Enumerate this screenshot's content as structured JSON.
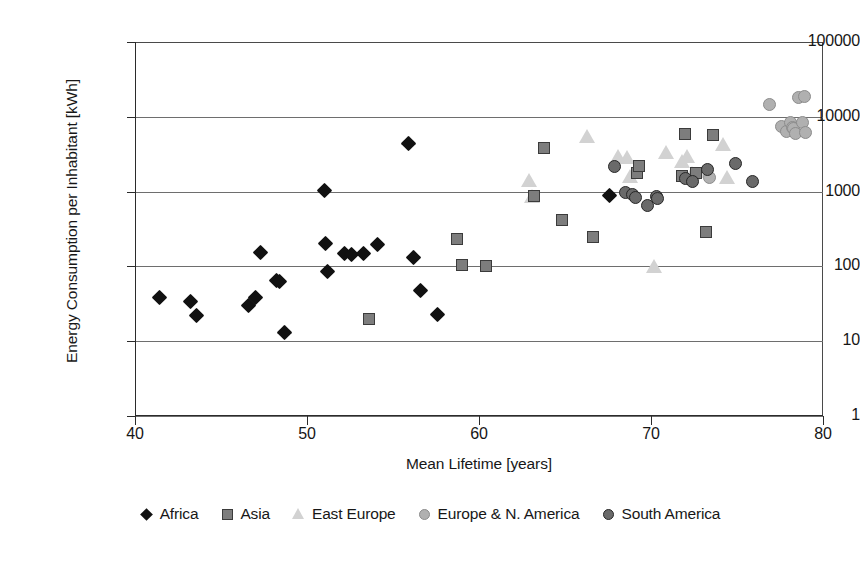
{
  "chart_data": {
    "type": "scatter",
    "title": "",
    "xlabel": "Mean Lifetime [years]",
    "ylabel": "Energy Consumption per Inhabitant [kWh]",
    "xlim": [
      40,
      80
    ],
    "ylim": [
      1,
      100000
    ],
    "yscale": "log",
    "xscale": "linear",
    "xticks": [
      "40",
      "50",
      "60",
      "70",
      "80"
    ],
    "yticks": [
      "1",
      "10",
      "100",
      "1000",
      "10000",
      "100000"
    ],
    "grid": "horizontal",
    "legend_position": "bottom",
    "series": [
      {
        "name": "Africa",
        "marker": "diamond",
        "color": "#111111",
        "points": [
          [
            41.4,
            38
          ],
          [
            43.2,
            34
          ],
          [
            43.6,
            22
          ],
          [
            46.6,
            30
          ],
          [
            47.0,
            38
          ],
          [
            47.3,
            155
          ],
          [
            48.2,
            65
          ],
          [
            48.4,
            62
          ],
          [
            48.7,
            13
          ],
          [
            51.0,
            1030
          ],
          [
            51.1,
            200
          ],
          [
            51.2,
            86
          ],
          [
            52.2,
            150
          ],
          [
            52.6,
            145
          ],
          [
            53.3,
            148
          ],
          [
            54.1,
            196
          ],
          [
            55.9,
            4400
          ],
          [
            56.2,
            130
          ],
          [
            56.6,
            47
          ],
          [
            57.6,
            23
          ],
          [
            67.6,
            880
          ]
        ]
      },
      {
        "name": "Asia",
        "marker": "square",
        "color": "#7d7d7d",
        "points": [
          [
            53.6,
            20
          ],
          [
            58.7,
            235
          ],
          [
            59.0,
            105
          ],
          [
            60.4,
            100
          ],
          [
            63.2,
            880
          ],
          [
            63.8,
            3800
          ],
          [
            64.8,
            420
          ],
          [
            66.6,
            250
          ],
          [
            69.2,
            1800
          ],
          [
            69.3,
            2200
          ],
          [
            71.8,
            1600
          ],
          [
            72.0,
            5800
          ],
          [
            72.6,
            1800
          ],
          [
            73.2,
            290
          ],
          [
            73.6,
            5700
          ]
        ]
      },
      {
        "name": "East Europe",
        "marker": "triangle",
        "color": "#d2d2d2",
        "points": [
          [
            62.9,
            1450
          ],
          [
            63.1,
            870
          ],
          [
            66.3,
            5600
          ],
          [
            68.1,
            3000
          ],
          [
            68.6,
            2900
          ],
          [
            68.8,
            1600
          ],
          [
            70.2,
            100
          ],
          [
            70.9,
            3400
          ],
          [
            71.8,
            2600
          ],
          [
            72.1,
            3000
          ],
          [
            72.4,
            1750
          ],
          [
            73.3,
            1900
          ],
          [
            74.2,
            4300
          ],
          [
            74.4,
            1550
          ]
        ]
      },
      {
        "name": "Europe & N. America",
        "marker": "circle",
        "color": "#b0b0b0",
        "points": [
          [
            73.4,
            1550
          ],
          [
            76.9,
            14500
          ],
          [
            77.6,
            7400
          ],
          [
            77.9,
            6300
          ],
          [
            78.1,
            8300
          ],
          [
            78.2,
            7200
          ],
          [
            78.3,
            6900
          ],
          [
            78.4,
            5900
          ],
          [
            78.6,
            18000
          ],
          [
            78.8,
            8500
          ],
          [
            78.9,
            18500
          ],
          [
            79.0,
            6100
          ]
        ]
      },
      {
        "name": "South America",
        "marker": "dark-circle",
        "color": "#6a6a6a",
        "points": [
          [
            67.9,
            2150
          ],
          [
            68.5,
            980
          ],
          [
            68.9,
            920
          ],
          [
            69.1,
            830
          ],
          [
            69.8,
            660
          ],
          [
            70.3,
            850
          ],
          [
            70.4,
            820
          ],
          [
            72.0,
            1500
          ],
          [
            72.4,
            1350
          ],
          [
            73.3,
            1950
          ],
          [
            74.9,
            2400
          ],
          [
            75.9,
            1350
          ]
        ]
      }
    ]
  },
  "axes": {
    "x_title": "Mean Lifetime [years]",
    "y_title": "Energy Consumption per Inhabitant [kWh]",
    "x_tick_labels": [
      "40",
      "50",
      "60",
      "70",
      "80"
    ],
    "y_tick_labels": [
      "100000",
      "10000",
      "1000",
      "100",
      "10",
      "1"
    ]
  },
  "legend": {
    "items": [
      {
        "label": "Africa",
        "marker": "diamond"
      },
      {
        "label": "Asia",
        "marker": "square"
      },
      {
        "label": "East Europe",
        "marker": "triangle"
      },
      {
        "label": "Europe & N. America",
        "marker": "circle"
      },
      {
        "label": "South America",
        "marker": "dark-circle"
      }
    ]
  },
  "colors": {
    "africa": "#111111",
    "asia": "#7d7d7d",
    "east_europe": "#d2d2d2",
    "europe_n_america": "#b0b0b0",
    "south_america": "#6a6a6a",
    "axis": "#2b2b2b",
    "grid": "#6e6e6e"
  }
}
